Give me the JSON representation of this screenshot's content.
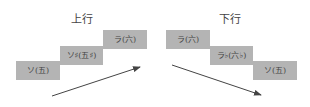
{
  "ascending": {
    "title": "上行",
    "notes": [
      {
        "label": "ソ(五)"
      },
      {
        "label": "ソ♯(五♯)"
      },
      {
        "label": "ラ(六)"
      }
    ],
    "arrow_direction": "up-right"
  },
  "descending": {
    "title": "下行",
    "notes": [
      {
        "label": "ラ(六)"
      },
      {
        "label": "ラ♭(六♭)"
      },
      {
        "label": "ソ(五)"
      }
    ],
    "arrow_direction": "down-right"
  },
  "colors": {
    "box_fill": "#b4b4b4",
    "arrow": "#444444",
    "text": "#444444"
  }
}
